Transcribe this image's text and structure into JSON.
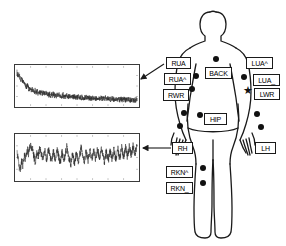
{
  "figure": {
    "background": "#ffffff",
    "ink_color": "#111111",
    "plot_border_color": "#3a3a3a"
  },
  "body": {
    "name": "human-body-outline",
    "orientation": "front view, arms at sides"
  },
  "sensors": [
    {
      "id": "RUA",
      "label": "RUA",
      "side": "right-upper-arm",
      "x": 166,
      "y": 57,
      "w": 25,
      "h": 12
    },
    {
      "id": "RUA^",
      "label": "RUA^",
      "side": "right-upper-arm-upper",
      "x": 164,
      "y": 73,
      "w": 27,
      "h": 12
    },
    {
      "id": "RWR",
      "label": "RWR",
      "side": "right-wrist",
      "x": 163,
      "y": 89,
      "w": 26,
      "h": 12
    },
    {
      "id": "BACK",
      "label": "BACK",
      "side": "torso-back",
      "x": 205,
      "y": 67,
      "w": 27,
      "h": 12
    },
    {
      "id": "LUA^",
      "label": "LUA^",
      "side": "left-upper-arm-upper",
      "x": 246,
      "y": 57,
      "w": 27,
      "h": 12
    },
    {
      "id": "LUA_",
      "label": "LUA_",
      "side": "left-upper-arm-lower",
      "x": 253,
      "y": 74,
      "w": 27,
      "h": 12
    },
    {
      "id": "LWR",
      "label": "LWR",
      "side": "left-wrist",
      "x": 254,
      "y": 88,
      "w": 26,
      "h": 12
    },
    {
      "id": "HIP",
      "label": "HIP",
      "side": "hip",
      "x": 204,
      "y": 113,
      "w": 23,
      "h": 12
    },
    {
      "id": "RH",
      "label": "RH",
      "side": "right-hand",
      "x": 172,
      "y": 142,
      "w": 21,
      "h": 12
    },
    {
      "id": "LH",
      "label": "LH",
      "side": "left-hand",
      "x": 255,
      "y": 142,
      "w": 21,
      "h": 12
    },
    {
      "id": "RKN^",
      "label": "RKN^",
      "side": "right-knee-upper",
      "x": 166,
      "y": 166,
      "w": 27,
      "h": 12
    },
    {
      "id": "RKN_",
      "label": "RKN_",
      "side": "right-knee-lower",
      "x": 166,
      "y": 182,
      "w": 27,
      "h": 12
    }
  ],
  "sensor_dots": [
    {
      "name": "dot-back",
      "x": 216,
      "y": 59,
      "r": 3.4
    },
    {
      "name": "dot-rua",
      "x": 196,
      "y": 76,
      "r": 3.4
    },
    {
      "name": "dot-rwr",
      "x": 192,
      "y": 89,
      "r": 3.4
    },
    {
      "name": "dot-rwrist",
      "x": 184,
      "y": 113,
      "r": 3.4
    },
    {
      "name": "dot-rhand",
      "x": 180,
      "y": 126,
      "r": 3.4
    },
    {
      "name": "dot-hip",
      "x": 200,
      "y": 115,
      "r": 3.4
    },
    {
      "name": "dot-lua",
      "x": 244,
      "y": 77,
      "r": 3.4
    },
    {
      "name": "dot-lwrist",
      "x": 257,
      "y": 114,
      "r": 3.4
    },
    {
      "name": "dot-lhand",
      "x": 261,
      "y": 127,
      "r": 3.4
    },
    {
      "name": "dot-rkn-up",
      "x": 203,
      "y": 168,
      "r": 3.4
    },
    {
      "name": "dot-rkn-lo",
      "x": 203,
      "y": 183,
      "r": 3.4
    }
  ],
  "star_marker": {
    "name": "star-marker-lwr",
    "glyph": "★",
    "x": 243,
    "y": 85
  },
  "callouts": [
    {
      "name": "callout-rua-to-top-plot",
      "from": "RUA",
      "to": "plot-top",
      "x1": 164,
      "y1": 64,
      "x2": 141,
      "y2": 79
    },
    {
      "name": "callout-rh-to-bottom-plot",
      "from": "RH",
      "to": "plot-bottom",
      "x1": 171,
      "y1": 148,
      "x2": 143,
      "y2": 148
    }
  ],
  "chart_data": [
    {
      "id": "plot-top",
      "type": "line",
      "title": "",
      "xlabel": "",
      "ylabel": "",
      "source_sensor": "RUA",
      "grid": true,
      "box": {
        "x": 14,
        "y": 64,
        "w": 126,
        "h": 44
      },
      "xlim": [
        0,
        1
      ],
      "ylim": [
        0,
        1
      ],
      "description": "noisy accelerometer-like trace decaying from high values at left to a low plateau at right",
      "values": [
        0.86,
        0.74,
        0.8,
        0.72,
        0.63,
        0.69,
        0.58,
        0.62,
        0.55,
        0.5,
        0.47,
        0.52,
        0.44,
        0.4,
        0.45,
        0.38,
        0.42,
        0.36,
        0.34,
        0.39,
        0.33,
        0.36,
        0.3,
        0.34,
        0.31,
        0.35,
        0.29,
        0.33,
        0.3,
        0.28,
        0.32,
        0.27,
        0.3,
        0.26,
        0.29,
        0.25,
        0.28,
        0.26,
        0.3,
        0.24,
        0.27,
        0.23,
        0.26,
        0.24,
        0.28,
        0.22,
        0.25,
        0.23,
        0.27,
        0.21,
        0.24,
        0.22,
        0.26,
        0.2,
        0.23,
        0.21,
        0.25,
        0.19,
        0.22,
        0.2,
        0.24,
        0.19,
        0.22,
        0.2,
        0.23,
        0.18,
        0.21,
        0.19,
        0.22,
        0.18,
        0.2,
        0.19,
        0.21,
        0.17,
        0.2,
        0.18,
        0.21,
        0.17,
        0.19,
        0.18,
        0.2,
        0.16,
        0.19,
        0.17,
        0.2,
        0.16,
        0.18,
        0.17,
        0.19,
        0.15,
        0.18,
        0.16,
        0.19,
        0.15,
        0.17,
        0.16,
        0.18,
        0.14,
        0.17,
        0.15,
        0.18,
        0.14,
        0.16,
        0.15,
        0.17,
        0.13,
        0.16,
        0.14,
        0.17,
        0.13,
        0.15,
        0.14,
        0.16,
        0.12,
        0.15,
        0.13,
        0.16,
        0.12,
        0.14,
        0.13,
        0.15,
        0.11,
        0.14,
        0.12,
        0.15,
        0.11
      ],
      "noise_amplitude": 0.07
    },
    {
      "id": "plot-bottom",
      "type": "line",
      "title": "",
      "xlabel": "",
      "ylabel": "",
      "source_sensor": "RH",
      "grid": true,
      "box": {
        "x": 14,
        "y": 133,
        "w": 126,
        "h": 49
      },
      "xlim": [
        0,
        1
      ],
      "ylim": [
        0,
        1
      ],
      "description": "quasi-periodic gait-like trace with about ten repeating peaks across the window",
      "values": [
        0.62,
        0.5,
        0.34,
        0.2,
        0.3,
        0.42,
        0.31,
        0.45,
        0.55,
        0.44,
        0.58,
        0.68,
        0.56,
        0.7,
        0.8,
        0.66,
        0.74,
        0.6,
        0.48,
        0.4,
        0.52,
        0.62,
        0.5,
        0.64,
        0.74,
        0.6,
        0.52,
        0.44,
        0.56,
        0.66,
        0.54,
        0.46,
        0.58,
        0.7,
        0.58,
        0.48,
        0.4,
        0.52,
        0.64,
        0.52,
        0.44,
        0.56,
        0.68,
        0.56,
        0.46,
        0.38,
        0.5,
        0.62,
        0.5,
        0.42,
        0.54,
        0.66,
        0.78,
        0.64,
        0.52,
        0.42,
        0.34,
        0.46,
        0.58,
        0.46,
        0.38,
        0.5,
        0.62,
        0.5,
        0.4,
        0.52,
        0.64,
        0.76,
        0.62,
        0.5,
        0.4,
        0.52,
        0.64,
        0.52,
        0.42,
        0.54,
        0.66,
        0.54,
        0.44,
        0.56,
        0.68,
        0.56,
        0.46,
        0.58,
        0.7,
        0.58,
        0.48,
        0.6,
        0.72,
        0.6,
        0.5,
        0.4,
        0.52,
        0.64,
        0.52,
        0.42,
        0.54,
        0.66,
        0.54,
        0.44,
        0.56,
        0.68,
        0.56,
        0.46,
        0.58,
        0.7,
        0.58,
        0.48,
        0.6,
        0.72,
        0.6,
        0.5,
        0.62,
        0.74,
        0.62,
        0.52,
        0.64,
        0.76,
        0.64,
        0.54,
        0.66,
        0.78,
        0.66,
        0.56,
        0.68,
        0.8
      ],
      "noise_amplitude": 0.09
    }
  ]
}
